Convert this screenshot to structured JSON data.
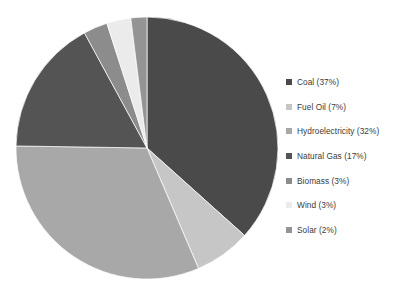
{
  "chart_data": {
    "type": "pie",
    "title": "",
    "subtitle": "",
    "xlabel": "",
    "ylabel": "",
    "legend_position": "right",
    "grid": false,
    "start_angle_deg": 0,
    "direction": "clockwise",
    "categories": [
      "Coal",
      "Fuel Oil",
      "Hydroelectricity",
      "Natural Gas",
      "Biomass",
      "Wind",
      "Solar"
    ],
    "values": [
      37,
      7,
      32,
      17,
      3,
      3,
      2
    ],
    "unit": "%",
    "slices": [
      {
        "label": "Coal",
        "value": 37,
        "percent_text": "37%",
        "legend_text": "Coal (37%)",
        "color": "#4a4a4a"
      },
      {
        "label": "Fuel Oil",
        "value": 7,
        "percent_text": "7%",
        "legend_text": "Fuel Oil (7%)",
        "color": "#c6c6c6"
      },
      {
        "label": "Hydroelectricity",
        "value": 32,
        "percent_text": "32%",
        "legend_text": "Hydroelectricity (32%)",
        "color": "#a8a8a8"
      },
      {
        "label": "Natural Gas",
        "value": 17,
        "percent_text": "17%",
        "legend_text": "Natural Gas (17%)",
        "color": "#545454"
      },
      {
        "label": "Biomass",
        "value": 3,
        "percent_text": "3%",
        "legend_text": "Biomass (3%)",
        "color": "#8c8c8c"
      },
      {
        "label": "Wind",
        "value": 3,
        "percent_text": "3%",
        "legend_text": "Wind (3%)",
        "color": "#ebebeb"
      },
      {
        "label": "Solar",
        "value": 2,
        "percent_text": "2%",
        "legend_text": "Solar (2%)",
        "color": "#949494"
      }
    ]
  },
  "legend": {
    "items": [
      {
        "label": "Coal (37%)",
        "color": "#4a4a4a",
        "swatch_name": "legend-swatch-coal"
      },
      {
        "label": "Fuel Oil (7%)",
        "color": "#c6c6c6",
        "swatch_name": "legend-swatch-fuel-oil"
      },
      {
        "label": "Hydroelectricity (32%)",
        "color": "#a8a8a8",
        "swatch_name": "legend-swatch-hydroelectricity"
      },
      {
        "label": "Natural Gas (17%)",
        "color": "#545454",
        "swatch_name": "legend-swatch-natural-gas"
      },
      {
        "label": "Biomass (3%)",
        "color": "#8c8c8c",
        "swatch_name": "legend-swatch-biomass"
      },
      {
        "label": "Wind (3%)",
        "color": "#ebebeb",
        "swatch_name": "legend-swatch-wind"
      },
      {
        "label": "Solar (2%)",
        "color": "#949494",
        "swatch_name": "legend-swatch-solar"
      }
    ]
  },
  "geometry": {
    "center_x": 147,
    "center_y": 148,
    "radius": 131
  },
  "colors": {
    "background": "#ffffff",
    "legend_text": "#3b3b3b"
  }
}
